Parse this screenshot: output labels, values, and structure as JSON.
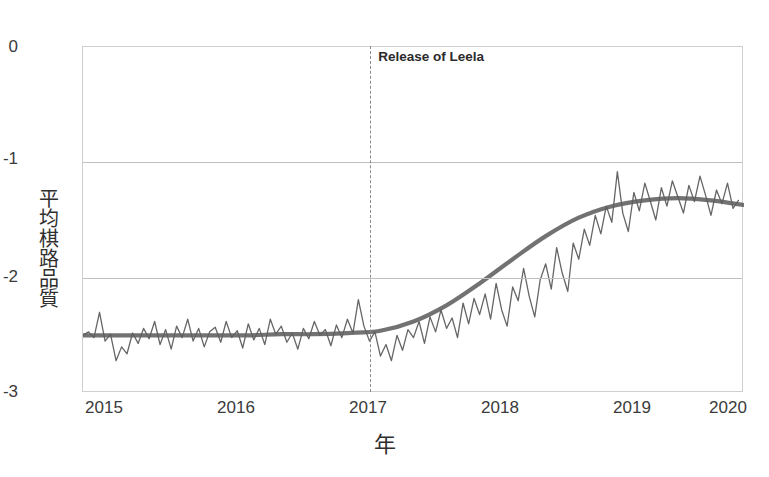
{
  "figure": {
    "title": "平均棋路品質 隨時間變化",
    "title_clipped": true
  },
  "axes": {
    "x": {
      "label": "年",
      "ticks": [
        "2015",
        "2016",
        "2017",
        "2018",
        "2019",
        "2020"
      ],
      "min": 2015,
      "max": 2020
    },
    "y": {
      "label": "平均棋路品質",
      "ticks": [
        "0",
        "-1",
        "-2",
        "-3"
      ],
      "min": -3,
      "max": 0,
      "gridlines": [
        -1,
        -2
      ]
    }
  },
  "annotation": {
    "label": "Release of Leela",
    "x_value": 2017.18,
    "line_style": "dashed"
  },
  "colors": {
    "series_line": "#666666",
    "trend_line": "#5e5e5e",
    "grid": "#bfbfbf",
    "frame": "#cfcfcf",
    "text": "#3b3b3b",
    "annotation_line": "#8a8a8a"
  },
  "chart_data": {
    "type": "line",
    "title": "平均棋路品質 隨時間變化",
    "xlabel": "年",
    "ylabel": "平均棋路品質",
    "xlim": [
      2015,
      2020
    ],
    "ylim": [
      -3,
      0
    ],
    "grid": true,
    "legend": "none",
    "annotations": [
      {
        "text": "Release of Leela",
        "x": 2017.18,
        "type": "vline-dashed"
      }
    ],
    "series": [
      {
        "name": "平均棋路品質 (月資料)",
        "type": "line",
        "x": [
          2015.0,
          2015.042,
          2015.083,
          2015.125,
          2015.167,
          2015.208,
          2015.25,
          2015.292,
          2015.333,
          2015.375,
          2015.417,
          2015.458,
          2015.5,
          2015.542,
          2015.583,
          2015.625,
          2015.667,
          2015.708,
          2015.75,
          2015.792,
          2015.833,
          2015.875,
          2015.917,
          2015.958,
          2016.0,
          2016.042,
          2016.083,
          2016.125,
          2016.167,
          2016.208,
          2016.25,
          2016.292,
          2016.333,
          2016.375,
          2016.417,
          2016.458,
          2016.5,
          2016.542,
          2016.583,
          2016.625,
          2016.667,
          2016.708,
          2016.75,
          2016.792,
          2016.833,
          2016.875,
          2016.917,
          2016.958,
          2017.0,
          2017.042,
          2017.083,
          2017.125,
          2017.167,
          2017.208,
          2017.25,
          2017.292,
          2017.333,
          2017.375,
          2017.417,
          2017.458,
          2017.5,
          2017.542,
          2017.583,
          2017.625,
          2017.667,
          2017.708,
          2017.75,
          2017.792,
          2017.833,
          2017.875,
          2017.917,
          2017.958,
          2018.0,
          2018.042,
          2018.083,
          2018.125,
          2018.167,
          2018.208,
          2018.25,
          2018.292,
          2018.333,
          2018.375,
          2018.417,
          2018.458,
          2018.5,
          2018.542,
          2018.583,
          2018.625,
          2018.667,
          2018.708,
          2018.75,
          2018.792,
          2018.833,
          2018.875,
          2018.917,
          2018.958,
          2019.0,
          2019.042,
          2019.083,
          2019.125,
          2019.167,
          2019.208,
          2019.25,
          2019.292,
          2019.333,
          2019.375,
          2019.417,
          2019.458,
          2019.5,
          2019.542,
          2019.583,
          2019.625,
          2019.667,
          2019.708,
          2019.75,
          2019.792,
          2019.833,
          2019.875,
          2019.917,
          2019.958
        ],
        "y": [
          -2.5,
          -2.47,
          -2.52,
          -2.3,
          -2.55,
          -2.49,
          -2.72,
          -2.6,
          -2.66,
          -2.48,
          -2.57,
          -2.44,
          -2.53,
          -2.38,
          -2.58,
          -2.45,
          -2.62,
          -2.42,
          -2.52,
          -2.36,
          -2.55,
          -2.44,
          -2.6,
          -2.47,
          -2.43,
          -2.56,
          -2.38,
          -2.52,
          -2.46,
          -2.61,
          -2.4,
          -2.54,
          -2.44,
          -2.58,
          -2.36,
          -2.49,
          -2.42,
          -2.56,
          -2.48,
          -2.62,
          -2.44,
          -2.53,
          -2.38,
          -2.5,
          -2.45,
          -2.59,
          -2.41,
          -2.52,
          -2.36,
          -2.48,
          -2.19,
          -2.42,
          -2.55,
          -2.47,
          -2.68,
          -2.58,
          -2.72,
          -2.5,
          -2.63,
          -2.45,
          -2.52,
          -2.38,
          -2.57,
          -2.34,
          -2.47,
          -2.28,
          -2.44,
          -2.35,
          -2.52,
          -2.22,
          -2.4,
          -2.18,
          -2.32,
          -2.14,
          -2.36,
          -2.05,
          -2.28,
          -2.42,
          -2.08,
          -2.2,
          -1.92,
          -2.16,
          -2.34,
          -2.02,
          -1.88,
          -2.1,
          -1.74,
          -1.96,
          -2.12,
          -1.7,
          -1.84,
          -1.58,
          -1.72,
          -1.46,
          -1.62,
          -1.38,
          -1.52,
          -1.08,
          -1.44,
          -1.6,
          -1.26,
          -1.42,
          -1.18,
          -1.34,
          -1.5,
          -1.22,
          -1.38,
          -1.16,
          -1.3,
          -1.44,
          -1.2,
          -1.34,
          -1.12,
          -1.28,
          -1.46,
          -1.24,
          -1.36,
          -1.18,
          -1.4,
          -1.33
        ]
      },
      {
        "name": "平滑趨勢線",
        "type": "line-smooth",
        "x": [
          2015.0,
          2015.25,
          2015.5,
          2015.75,
          2016.0,
          2016.25,
          2016.5,
          2016.75,
          2017.0,
          2017.25,
          2017.5,
          2017.75,
          2018.0,
          2018.25,
          2018.5,
          2018.75,
          2019.0,
          2019.25,
          2019.5,
          2019.75,
          2020.0
        ],
        "y": [
          -2.5,
          -2.5,
          -2.5,
          -2.5,
          -2.5,
          -2.5,
          -2.49,
          -2.49,
          -2.48,
          -2.46,
          -2.38,
          -2.24,
          -2.05,
          -1.84,
          -1.64,
          -1.48,
          -1.38,
          -1.33,
          -1.31,
          -1.33,
          -1.37
        ]
      }
    ]
  }
}
